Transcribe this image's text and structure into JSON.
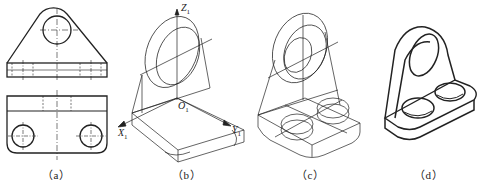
{
  "figure": {
    "panels": [
      {
        "id": "a",
        "caption": "（a）",
        "description": "Orthographic views: front view (top) and top view (bottom)"
      },
      {
        "id": "b",
        "caption": "（b）",
        "description": "Isometric construction with axes"
      },
      {
        "id": "c",
        "caption": "（c）",
        "description": "Isometric with holes and ellipses drawn"
      },
      {
        "id": "d",
        "caption": "（d）",
        "description": "Finished isometric drawing"
      }
    ],
    "axes": {
      "z": "Z",
      "x": "X",
      "y": "Y",
      "origin": "O",
      "subscript": "1"
    },
    "colors": {
      "line": "#222222",
      "background": "#ffffff"
    }
  }
}
